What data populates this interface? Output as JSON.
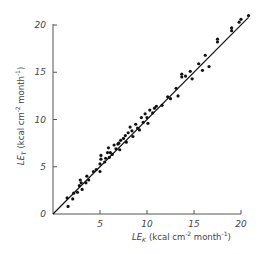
{
  "chart_data": {
    "type": "scatter",
    "title": "",
    "xlabel": "LE_K (kcal cm^-2 month^-1)",
    "ylabel": "LE_T (kcal cm^-2 month^-1)",
    "xlabel_parts": {
      "main": "LE",
      "sub": "K",
      "unit": "(kcal cm",
      "exp1": "-2",
      "unit2": " month",
      "exp2": "-1",
      "close": ")"
    },
    "ylabel_parts": {
      "main": "LE",
      "sub": "T",
      "unit": "(kcal cm",
      "exp1": "-2",
      "unit2": " month",
      "exp2": "-1",
      "close": ")"
    },
    "xlim": [
      0,
      21
    ],
    "ylim": [
      0,
      21
    ],
    "x_ticks": [
      5,
      10,
      15,
      20
    ],
    "y_ticks": [
      0,
      5,
      10,
      15,
      20
    ],
    "x_tick_labels": [
      "5",
      "10",
      "15",
      "20"
    ],
    "y_tick_labels": [
      "0",
      "5",
      "10",
      "15",
      "20"
    ],
    "grid": false,
    "legend": null,
    "fit_line": {
      "x": [
        0,
        20.8
      ],
      "y": [
        0,
        20.8
      ],
      "label": "1:1 line"
    },
    "points": [
      [
        1.5,
        1.7
      ],
      [
        1.6,
        0.8
      ],
      [
        2.1,
        1.6
      ],
      [
        2.2,
        2.2
      ],
      [
        2.6,
        2.3
      ],
      [
        2.8,
        3.0
      ],
      [
        2.9,
        3.6
      ],
      [
        3.0,
        3.3
      ],
      [
        3.1,
        2.6
      ],
      [
        3.5,
        3.3
      ],
      [
        3.6,
        4.0
      ],
      [
        3.8,
        3.6
      ],
      [
        4.3,
        4.5
      ],
      [
        4.6,
        4.7
      ],
      [
        5.0,
        4.5
      ],
      [
        5.0,
        5.3
      ],
      [
        5.1,
        5.8
      ],
      [
        5.1,
        6.2
      ],
      [
        5.5,
        5.5
      ],
      [
        5.6,
        5.9
      ],
      [
        5.8,
        6.5
      ],
      [
        5.9,
        7.0
      ],
      [
        6.0,
        6.0
      ],
      [
        6.1,
        6.5
      ],
      [
        6.3,
        6.3
      ],
      [
        6.5,
        7.3
      ],
      [
        6.7,
        6.9
      ],
      [
        6.9,
        7.4
      ],
      [
        7.0,
        7.5
      ],
      [
        7.1,
        6.8
      ],
      [
        7.2,
        7.8
      ],
      [
        7.5,
        8.0
      ],
      [
        7.7,
        8.3
      ],
      [
        7.8,
        7.6
      ],
      [
        8.0,
        8.6
      ],
      [
        8.2,
        9.2
      ],
      [
        8.4,
        8.8
      ],
      [
        8.5,
        8.2
      ],
      [
        8.8,
        9.5
      ],
      [
        9.0,
        9.1
      ],
      [
        9.2,
        8.9
      ],
      [
        9.4,
        10.2
      ],
      [
        9.6,
        9.7
      ],
      [
        9.8,
        10.6
      ],
      [
        10.0,
        10.2
      ],
      [
        10.1,
        9.6
      ],
      [
        10.3,
        11.0
      ],
      [
        10.6,
        10.7
      ],
      [
        10.8,
        11.2
      ],
      [
        11.0,
        11.4
      ],
      [
        11.6,
        11.5
      ],
      [
        12.2,
        12.4
      ],
      [
        12.5,
        12.2
      ],
      [
        13.1,
        13.3
      ],
      [
        13.3,
        12.5
      ],
      [
        13.7,
        14.5
      ],
      [
        13.7,
        14.8
      ],
      [
        14.1,
        14.6
      ],
      [
        14.6,
        15.1
      ],
      [
        14.8,
        14.3
      ],
      [
        15.5,
        15.9
      ],
      [
        15.9,
        15.2
      ],
      [
        16.2,
        16.8
      ],
      [
        16.6,
        15.6
      ],
      [
        17.5,
        18.2
      ],
      [
        17.5,
        18.5
      ],
      [
        19.0,
        19.4
      ],
      [
        19.0,
        19.7
      ],
      [
        19.8,
        20.3
      ],
      [
        20.0,
        20.6
      ],
      [
        20.8,
        21.0
      ]
    ]
  },
  "axes": {
    "origin_label": "0"
  }
}
